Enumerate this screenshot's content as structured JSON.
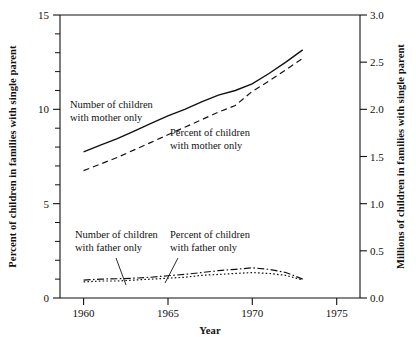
{
  "chart_data": {
    "type": "line",
    "title": "",
    "xlabel": "Year",
    "ylabel": "Percent of children in families with single parent",
    "ylabel_right": "Millions of children in families with single parent",
    "xlim": [
      1958.6,
      1976.4
    ],
    "ylim": [
      0,
      15
    ],
    "ylim_right": [
      0.0,
      3.0
    ],
    "grid": false,
    "legend_position": "inline-annotations",
    "xticks": [
      1960,
      1965,
      1970,
      1975
    ],
    "xtick_labels": [
      "1960",
      "1965",
      "1970",
      "1975"
    ],
    "yticks": [
      0,
      5,
      10,
      15
    ],
    "ytick_labels": [
      "0",
      "5",
      "10",
      "15"
    ],
    "yticks_minor": [
      1,
      2,
      3,
      4,
      6,
      7,
      8,
      9,
      11,
      12,
      13,
      14
    ],
    "yticks_right": [
      0.0,
      0.5,
      1.0,
      1.5,
      2.0,
      2.5,
      3.0
    ],
    "ytick_labels_right": [
      "0.0",
      "0.5",
      "1.0",
      "1.5",
      "2.0",
      "2.5",
      "3.0"
    ],
    "series": [
      {
        "name": "Number of children with mother only",
        "axis": "right",
        "style": "solid",
        "x": [
          1960,
          1961,
          1962,
          1963,
          1964,
          1965,
          1966,
          1967,
          1968,
          1969,
          1970,
          1971,
          1972,
          1973
        ],
        "values": [
          1.55,
          1.62,
          1.69,
          1.77,
          1.85,
          1.93,
          2.0,
          2.08,
          2.15,
          2.2,
          2.27,
          2.38,
          2.5,
          2.63
        ]
      },
      {
        "name": "Percent of children with mother only",
        "axis": "left",
        "style": "dashed",
        "x": [
          1960,
          1961,
          1962,
          1963,
          1964,
          1965,
          1966,
          1967,
          1968,
          1969,
          1970,
          1971,
          1972,
          1973
        ],
        "values": [
          6.75,
          7.1,
          7.45,
          7.85,
          8.25,
          8.65,
          9.05,
          9.45,
          9.85,
          10.2,
          10.95,
          11.5,
          12.1,
          12.7
        ]
      },
      {
        "name": "Number of children with father only",
        "axis": "right",
        "style": "dotted",
        "x": [
          1960,
          1961,
          1962,
          1963,
          1964,
          1965,
          1966,
          1967,
          1968,
          1969,
          1970,
          1971,
          1972,
          1973
        ],
        "values": [
          0.17,
          0.18,
          0.18,
          0.19,
          0.2,
          0.21,
          0.22,
          0.24,
          0.25,
          0.26,
          0.27,
          0.26,
          0.24,
          0.19
        ]
      },
      {
        "name": "Percent of children with father only",
        "axis": "left",
        "style": "dashdot",
        "x": [
          1960,
          1961,
          1962,
          1963,
          1964,
          1965,
          1966,
          1967,
          1968,
          1969,
          1970,
          1971,
          1972,
          1973
        ],
        "values": [
          0.95,
          1.0,
          1.02,
          1.05,
          1.1,
          1.18,
          1.25,
          1.35,
          1.45,
          1.52,
          1.6,
          1.52,
          1.35,
          1.0
        ]
      }
    ],
    "annotations": [
      {
        "id": "annot-mother-number",
        "line1": "Number of children",
        "line2": "with mother only"
      },
      {
        "id": "annot-mother-percent",
        "line1": "Percent of children",
        "line2": "with mother only"
      },
      {
        "id": "annot-father-number",
        "line1": "Number of children",
        "line2": "with father only"
      },
      {
        "id": "annot-father-percent",
        "line1": "Percent of children",
        "line2": "with father only"
      }
    ],
    "colors": {
      "line": "#111111",
      "background": "#ffffff",
      "axis": "#111111"
    }
  }
}
